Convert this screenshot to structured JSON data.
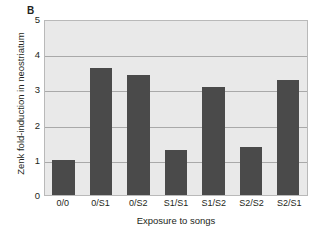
{
  "panel": {
    "letter": "B"
  },
  "chart_data": {
    "type": "bar",
    "title": "",
    "categories": [
      "0/0",
      "0/S1",
      "0/S2",
      "S1/S1",
      "S1/S2",
      "S2/S2",
      "S2/S1"
    ],
    "values": [
      1.0,
      3.65,
      3.45,
      1.28,
      3.1,
      1.37,
      3.3
    ],
    "xlabel": "Exposure to songs",
    "ylabel": "Zenk fold-induction in neostriatum",
    "ylim": [
      0,
      5
    ],
    "yticks": [
      "0",
      "1",
      "2",
      "3",
      "4",
      "5"
    ],
    "grid": true,
    "legend": "none",
    "colors": {
      "bar": "#4a4a4a",
      "plot_background": "#e9e9e9",
      "gridline": "#a9a9a9",
      "axis": "#b9b9b9",
      "text": "#231f20"
    }
  }
}
